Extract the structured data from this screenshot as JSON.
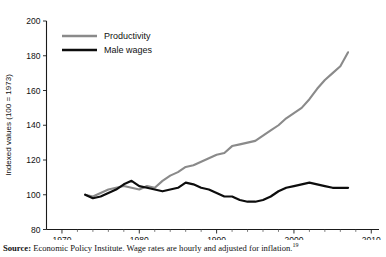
{
  "top_bleed_text": "",
  "chart_data": {
    "type": "line",
    "title": "",
    "xlabel": "",
    "ylabel": "Indexed values (100 = 1973)",
    "xlim": [
      1968,
      2011
    ],
    "ylim": [
      80,
      200
    ],
    "xticks": [
      1970,
      1980,
      1990,
      2000,
      2010
    ],
    "yticks": [
      80,
      100,
      120,
      140,
      160,
      180,
      200
    ],
    "xtick_labels": [
      "1970",
      "1980",
      "1990",
      "2000",
      "2010"
    ],
    "ytick_labels": [
      "80",
      "100",
      "120",
      "140",
      "160",
      "180",
      "200"
    ],
    "minor_xtick_step": 2,
    "grid": false,
    "legend_position": "upper-left-inside",
    "series": [
      {
        "name": "Productivity",
        "color": "#8a8a8a",
        "x": [
          1973,
          1974,
          1975,
          1976,
          1977,
          1978,
          1979,
          1980,
          1981,
          1982,
          1983,
          1984,
          1985,
          1986,
          1987,
          1988,
          1989,
          1990,
          1991,
          1992,
          1993,
          1994,
          1995,
          1996,
          1997,
          1998,
          1999,
          2000,
          2001,
          2002,
          2003,
          2004,
          2005,
          2006,
          2007
        ],
        "values": [
          100,
          99,
          101,
          103,
          104,
          105,
          104,
          103,
          105,
          104,
          108,
          111,
          113,
          116,
          117,
          119,
          121,
          123,
          124,
          128,
          129,
          130,
          131,
          134,
          137,
          140,
          144,
          147,
          150,
          155,
          161,
          166,
          170,
          174,
          182
        ]
      },
      {
        "name": "Male wages",
        "color": "#0d0d0d",
        "x": [
          1973,
          1974,
          1975,
          1976,
          1977,
          1978,
          1979,
          1980,
          1981,
          1982,
          1983,
          1984,
          1985,
          1986,
          1987,
          1988,
          1989,
          1990,
          1991,
          1992,
          1993,
          1994,
          1995,
          1996,
          1997,
          1998,
          1999,
          2000,
          2001,
          2002,
          2003,
          2004,
          2005,
          2006,
          2007
        ],
        "values": [
          100,
          98,
          99,
          101,
          103,
          106,
          108,
          105,
          104,
          103,
          102,
          103,
          104,
          107,
          106,
          104,
          103,
          101,
          99,
          99,
          97,
          96,
          96,
          97,
          99,
          102,
          104,
          105,
          106,
          107,
          106,
          105,
          104,
          104,
          104
        ]
      }
    ]
  },
  "legend": {
    "items": [
      {
        "label": "Productivity",
        "color": "#8a8a8a"
      },
      {
        "label": "Male wages",
        "color": "#0d0d0d"
      }
    ]
  },
  "source": {
    "prefix": "Source:",
    "text": "Economic Policy Institute. Wage rates are hourly and adjusted for inflation.",
    "footnote_marker": "19"
  }
}
